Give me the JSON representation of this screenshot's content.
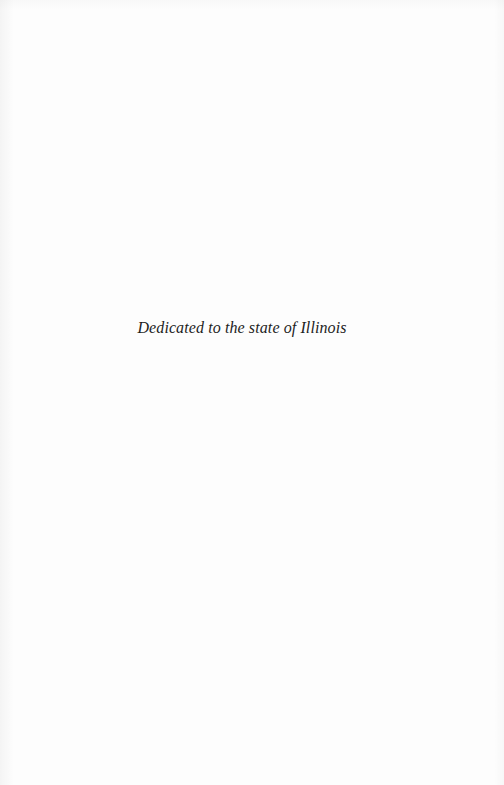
{
  "page": {
    "dedication": "Dedicated to the state of Illinois"
  },
  "colors": {
    "background": "#fdfdfd",
    "text": "#1e1e1e"
  }
}
